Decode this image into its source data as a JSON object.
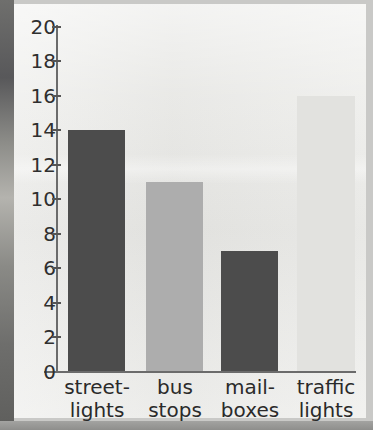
{
  "chart_data": {
    "type": "bar",
    "title": "",
    "xlabel": "",
    "ylabel": "",
    "categories": [
      "street-lights",
      "bus stops",
      "mail-boxes",
      "traffic lights"
    ],
    "category_lines": [
      [
        "street-",
        "lights"
      ],
      [
        "bus",
        "stops"
      ],
      [
        "mail-",
        "boxes"
      ],
      [
        "traffic",
        "lights"
      ]
    ],
    "values": [
      14,
      11,
      7,
      16
    ],
    "ylim": [
      0,
      20
    ],
    "ytick_step": 2,
    "yticks": [
      "20",
      "18",
      "16",
      "14",
      "12",
      "10",
      "8",
      "6",
      "4",
      "2",
      "0"
    ],
    "grid": false,
    "legend": "none",
    "bar_colors": [
      "#4c4c4c",
      "#adadad",
      "#4c4c4c",
      "#e2e2df"
    ]
  },
  "colors": {
    "page_background": "#e9e9e6",
    "frame": "#9a9a98",
    "axis": "#6b6b6b",
    "text": "#2a2a2a"
  }
}
